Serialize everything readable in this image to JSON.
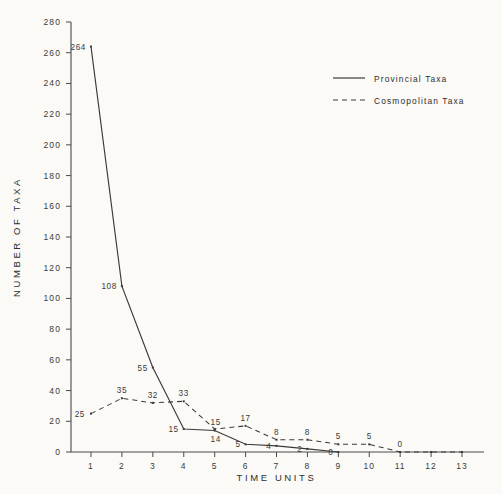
{
  "chart_data": {
    "type": "line",
    "title": "",
    "xlabel": "TIME  UNITS",
    "ylabel": "NUMBER OF TAXA",
    "x": [
      1,
      2,
      3,
      4,
      5,
      6,
      7,
      8,
      9,
      10,
      11,
      12,
      13
    ],
    "xtick_labels": [
      "1",
      "2",
      "3",
      "4",
      "5",
      "6",
      "7",
      "8",
      "9",
      "10",
      "11",
      "12",
      "13"
    ],
    "ytick_labels": [
      "0",
      "20",
      "40",
      "60",
      "80",
      "100",
      "120",
      "140",
      "160",
      "180",
      "200",
      "220",
      "240",
      "260",
      "280"
    ],
    "ytick_values": [
      0,
      20,
      40,
      60,
      80,
      100,
      120,
      140,
      160,
      180,
      200,
      220,
      240,
      260,
      280
    ],
    "ylim": [
      0,
      280
    ],
    "xlim": [
      1,
      13
    ],
    "grid": false,
    "legend_position": "upper-right",
    "series": [
      {
        "name": "Provincial Taxa",
        "style": "solid",
        "color": "#3a3a3a",
        "x": [
          1,
          2,
          3,
          4,
          5,
          6,
          7,
          8,
          9
        ],
        "values": [
          264,
          108,
          55,
          15,
          14,
          5,
          4,
          2,
          0
        ],
        "point_labels": [
          "264",
          "108",
          "55",
          "15",
          "14",
          "5",
          "4",
          "2",
          "0"
        ]
      },
      {
        "name": "Cosmopolitan Taxa",
        "style": "dashed",
        "color": "#3a3a3a",
        "x": [
          1,
          2,
          3,
          4,
          5,
          6,
          7,
          8,
          9,
          10,
          11,
          12,
          13
        ],
        "values": [
          25,
          35,
          32,
          33,
          15,
          17,
          8,
          8,
          5,
          5,
          0,
          0,
          0
        ],
        "point_labels": [
          "25",
          "35",
          "32",
          "33",
          "15",
          "17",
          "8",
          "8",
          "5",
          "5",
          "0",
          "",
          ""
        ]
      }
    ]
  },
  "legend": {
    "entries": [
      {
        "label": "Provincial  Taxa",
        "style": "solid"
      },
      {
        "label": "Cosmopolitan  Taxa",
        "style": "dashed"
      }
    ]
  },
  "axes": {
    "y_title": "NUMBER OF TAXA",
    "x_title": "TIME  UNITS"
  }
}
